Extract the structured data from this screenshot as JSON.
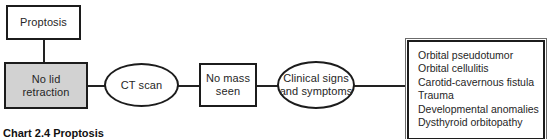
{
  "figure": {
    "caption": "Chart 2.4  Proptosis"
  },
  "nodes": {
    "proptosis": {
      "label": "Proptosis",
      "shape": "rectangle",
      "fill": "#ffffff"
    },
    "no_lid_retraction": {
      "label": "No lid\nretraction",
      "shape": "rectangle",
      "fill": "#d2d2d2"
    },
    "ct_scan": {
      "label": "CT scan",
      "shape": "ellipse",
      "fill": "#ffffff"
    },
    "no_mass_seen": {
      "label": "No mass\nseen",
      "shape": "rectangle",
      "fill": "#ffffff"
    },
    "clinical_signs": {
      "label": "Clinical signs\nand symptoms",
      "shape": "ellipse",
      "fill": "#ffffff"
    }
  },
  "diagnoses_box": {
    "items": [
      "Orbital pseudotumor",
      "Orbital cellulitis",
      "Carotid-cavernous fistula",
      "Trauma",
      "Developmental anomalies",
      "Dysthyroid orbitopathy"
    ]
  },
  "colors": {
    "stroke": "#1c1c1c",
    "fill_highlight": "#d2d2d2",
    "background": "#ffffff",
    "text": "#262626"
  }
}
